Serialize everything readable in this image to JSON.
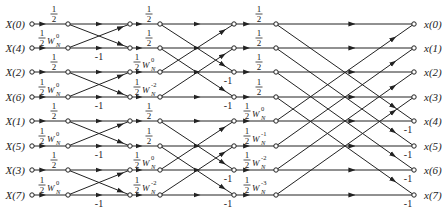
{
  "diagram": {
    "colors": {
      "line": "#222222",
      "node_fill": "#ffffff",
      "text": "#222222"
    },
    "rows_y": [
      24,
      48,
      72,
      97,
      121,
      146,
      170,
      195
    ],
    "columns_x": {
      "input": 32,
      "s1_in": 68,
      "s1_out": 130,
      "s2_in": 160,
      "s2_out": 234,
      "s3_in": 276,
      "output": 414
    },
    "inputs": [
      "X(0)",
      "X(4)",
      "X(2)",
      "X(6)",
      "X(1)",
      "X(5)",
      "X(3)",
      "X(7)"
    ],
    "outputs": [
      "x(0)",
      "x(1)",
      "x(2)",
      "x(3)",
      "x(4)",
      "x(5)",
      "x(6)",
      "x(7)"
    ],
    "stage1": {
      "coefficients": [
        {
          "frac": "1/2",
          "w": ""
        },
        {
          "frac": "1/2",
          "w": "W",
          "sub": "N",
          "sup": "0"
        },
        {
          "frac": "1/2",
          "w": ""
        },
        {
          "frac": "1/2",
          "w": "W",
          "sub": "N",
          "sup": "0"
        },
        {
          "frac": "1/2",
          "w": ""
        },
        {
          "frac": "1/2",
          "w": "W",
          "sub": "N",
          "sup": "0"
        },
        {
          "frac": "1/2",
          "w": ""
        },
        {
          "frac": "1/2",
          "w": "W",
          "sub": "N",
          "sup": "0"
        }
      ],
      "pairs": [
        [
          0,
          1
        ],
        [
          2,
          3
        ],
        [
          4,
          5
        ],
        [
          6,
          7
        ]
      ],
      "neg_label": "-1",
      "neg_rows": [
        1,
        3,
        5,
        7
      ]
    },
    "stage2": {
      "coefficients": [
        {
          "frac": "1/2",
          "w": ""
        },
        {
          "frac": "1/2",
          "w": ""
        },
        {
          "frac": "1/2",
          "w": "W",
          "sub": "N",
          "sup": "0"
        },
        {
          "frac": "1/2",
          "w": "W",
          "sub": "N",
          "sup": "-2"
        },
        {
          "frac": "1/2",
          "w": ""
        },
        {
          "frac": "1/2",
          "w": ""
        },
        {
          "frac": "1/2",
          "w": "W",
          "sub": "N",
          "sup": "0"
        },
        {
          "frac": "1/2",
          "w": "W",
          "sub": "N",
          "sup": "-2"
        }
      ],
      "pairs": [
        [
          0,
          2
        ],
        [
          1,
          3
        ],
        [
          4,
          6
        ],
        [
          5,
          7
        ]
      ],
      "neg_label": "-1",
      "neg_rows": [
        2,
        3,
        6,
        7
      ]
    },
    "stage3": {
      "coefficients": [
        {
          "frac": "1/2",
          "w": ""
        },
        {
          "frac": "1/2",
          "w": ""
        },
        {
          "frac": "1/2",
          "w": ""
        },
        {
          "frac": "1/2",
          "w": ""
        },
        {
          "frac": "1/2",
          "w": "W",
          "sub": "N",
          "sup": "0"
        },
        {
          "frac": "1/2",
          "w": "W",
          "sub": "N",
          "sup": "-1"
        },
        {
          "frac": "1/2",
          "w": "W",
          "sub": "N",
          "sup": "-2"
        },
        {
          "frac": "1/2",
          "w": "W",
          "sub": "N",
          "sup": "-3"
        }
      ],
      "pairs": [
        [
          0,
          4
        ],
        [
          1,
          5
        ],
        [
          2,
          6
        ],
        [
          3,
          7
        ]
      ],
      "neg_label": "-1",
      "neg_rows": [
        4,
        5,
        6,
        7
      ]
    }
  }
}
